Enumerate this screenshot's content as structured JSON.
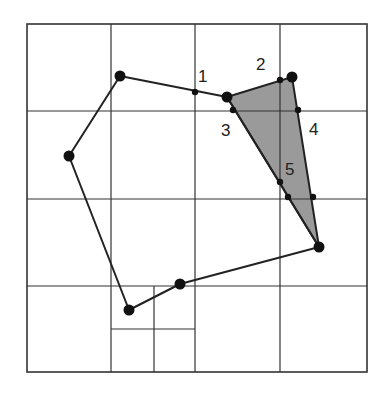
{
  "diagram": {
    "colors": {
      "line": "#333333",
      "edge": "#222222",
      "shade": "#9a9a9a",
      "point": "#111111",
      "background": "#ffffff"
    },
    "border": {
      "x": 27,
      "y": 24,
      "w": 340,
      "h": 348
    },
    "grid_lines": [
      {
        "x1": 111,
        "y1": 24,
        "x2": 111,
        "y2": 372
      },
      {
        "x1": 195,
        "y1": 24,
        "x2": 195,
        "y2": 372
      },
      {
        "x1": 280,
        "y1": 24,
        "x2": 280,
        "y2": 372
      },
      {
        "x1": 27,
        "y1": 111,
        "x2": 367,
        "y2": 111
      },
      {
        "x1": 27,
        "y1": 199,
        "x2": 367,
        "y2": 199
      },
      {
        "x1": 27,
        "y1": 286,
        "x2": 367,
        "y2": 286
      },
      {
        "x1": 154,
        "y1": 286,
        "x2": 154,
        "y2": 372
      },
      {
        "x1": 111,
        "y1": 329,
        "x2": 195,
        "y2": 329
      }
    ],
    "polygon_vertices": [
      {
        "x": 120,
        "y": 76
      },
      {
        "x": 227,
        "y": 97
      },
      {
        "x": 292,
        "y": 77
      },
      {
        "x": 319,
        "y": 247
      },
      {
        "x": 180,
        "y": 284
      },
      {
        "x": 129,
        "y": 310
      },
      {
        "x": 69,
        "y": 156
      }
    ],
    "polygon_edges": [
      [
        {
          "x": 120,
          "y": 76
        },
        {
          "x": 227,
          "y": 97
        }
      ],
      [
        {
          "x": 227,
          "y": 97
        },
        {
          "x": 319,
          "y": 247
        }
      ],
      [
        {
          "x": 319,
          "y": 247
        },
        {
          "x": 180,
          "y": 284
        }
      ],
      [
        {
          "x": 180,
          "y": 284
        },
        {
          "x": 129,
          "y": 310
        }
      ],
      [
        {
          "x": 129,
          "y": 310
        },
        {
          "x": 69,
          "y": 156
        }
      ],
      [
        {
          "x": 69,
          "y": 156
        },
        {
          "x": 120,
          "y": 76
        }
      ]
    ],
    "shaded_triangle": [
      {
        "x": 227,
        "y": 97
      },
      {
        "x": 292,
        "y": 77
      },
      {
        "x": 319,
        "y": 247
      }
    ],
    "intersection_points": [
      {
        "x": 195,
        "y": 92
      },
      {
        "x": 280,
        "y": 80
      },
      {
        "x": 233,
        "y": 110
      },
      {
        "x": 298,
        "y": 110
      },
      {
        "x": 280,
        "y": 182
      },
      {
        "x": 288,
        "y": 197
      },
      {
        "x": 313,
        "y": 197
      }
    ],
    "labels": [
      {
        "text": "1",
        "x": 198,
        "y": 82
      },
      {
        "text": "2",
        "x": 256,
        "y": 70
      },
      {
        "text": "3",
        "x": 221,
        "y": 136
      },
      {
        "text": "4",
        "x": 309,
        "y": 135
      },
      {
        "text": "5",
        "x": 285,
        "y": 175
      }
    ]
  }
}
